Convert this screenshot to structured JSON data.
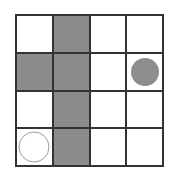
{
  "grid": {
    "rows": 4,
    "cols": 4,
    "colors": {
      "shaded": "#8c8c8c",
      "empty": "#ffffff",
      "line": "#333333",
      "filled_piece": "#8e8e8e"
    },
    "cells": [
      [
        "empty",
        "shaded",
        "empty",
        "empty"
      ],
      [
        "shaded",
        "shaded",
        "empty",
        "filled-circle"
      ],
      [
        "empty",
        "shaded",
        "empty",
        "empty"
      ],
      [
        "hollow-circle",
        "shaded",
        "empty",
        "empty"
      ]
    ]
  }
}
